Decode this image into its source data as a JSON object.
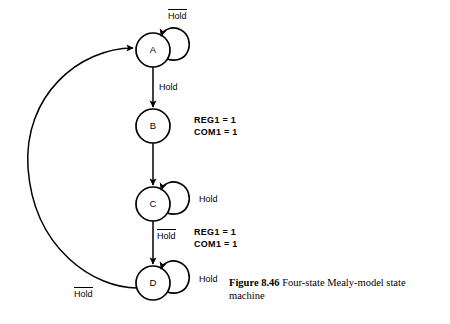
{
  "figure": {
    "caption_number": "Figure 8.46",
    "caption_text": "Four-state Mealy-model state machine"
  },
  "diagram": {
    "type": "state-machine",
    "model": "Mealy",
    "state_count": 4,
    "states": [
      {
        "id": "A",
        "label": "A",
        "cx": 153,
        "cy": 50,
        "r": 17
      },
      {
        "id": "B",
        "label": "B",
        "cx": 153,
        "cy": 126,
        "r": 17
      },
      {
        "id": "C",
        "label": "C",
        "cx": 153,
        "cy": 204,
        "r": 17
      },
      {
        "id": "D",
        "label": "D",
        "cx": 153,
        "cy": 283,
        "r": 17
      }
    ],
    "transitions": [
      {
        "from": "A",
        "to": "A",
        "kind": "self-loop",
        "condition": "Hold",
        "overline": true
      },
      {
        "from": "A",
        "to": "B",
        "kind": "straight",
        "condition": "Hold",
        "overline": false
      },
      {
        "from": "B",
        "to": "C",
        "kind": "straight",
        "condition": "",
        "overline": false
      },
      {
        "from": "C",
        "to": "C",
        "kind": "self-loop",
        "condition": "Hold",
        "overline": false
      },
      {
        "from": "C",
        "to": "D",
        "kind": "straight",
        "condition": "Hold",
        "overline": true
      },
      {
        "from": "D",
        "to": "D",
        "kind": "self-loop",
        "condition": "Hold",
        "overline": false
      },
      {
        "from": "D",
        "to": "A",
        "kind": "arc",
        "condition": "Hold",
        "overline": true
      }
    ],
    "labels": {
      "self_loop_a": "Hold",
      "a_to_b": "Hold",
      "self_loop_c": "Hold",
      "c_to_d": "Hold",
      "self_loop_d": "Hold",
      "d_to_a": "Hold"
    },
    "outputs": [
      {
        "near_state": "B",
        "lines": [
          "REG1  =  1",
          "COM1  =  1"
        ]
      },
      {
        "near_state": "D",
        "lines": [
          "REG1  =  1",
          "COM1  =  1"
        ]
      }
    ],
    "colors": {
      "stroke": "#000000",
      "background": "#ffffff",
      "text": "#000000"
    }
  }
}
